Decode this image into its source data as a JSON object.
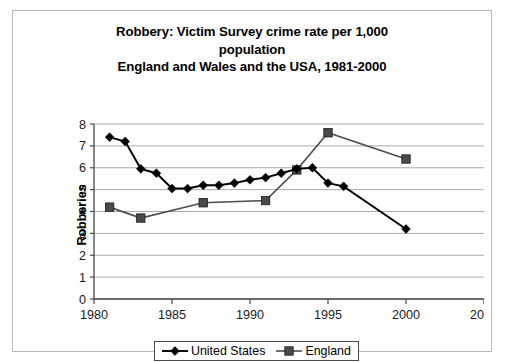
{
  "chart_data": {
    "type": "line",
    "title": "Robbery: Victim Survey crime rate per 1,000 population England and Wales and the USA, 1981-2000",
    "title_lines": [
      "Robbery: Victim Survey crime rate per 1,000",
      "population",
      "England and Wales and the USA, 1981-2000"
    ],
    "xlabel": "",
    "ylabel": "Robberies",
    "xlim": [
      1980,
      2005
    ],
    "ylim": [
      0,
      8
    ],
    "xticks": [
      1980,
      1985,
      1990,
      1995,
      2000,
      2005
    ],
    "yticks": [
      0,
      1,
      2,
      3,
      4,
      5,
      6,
      7,
      8
    ],
    "grid": "horizontal",
    "legend_position": "bottom",
    "series": [
      {
        "name": "United States",
        "marker": "diamond",
        "color": "#000000",
        "x": [
          1981,
          1982,
          1983,
          1984,
          1985,
          1986,
          1987,
          1988,
          1989,
          1990,
          1991,
          1992,
          1993,
          1994,
          1995,
          1996,
          2000
        ],
        "values": [
          7.4,
          7.2,
          5.95,
          5.75,
          5.05,
          5.05,
          5.2,
          5.2,
          5.3,
          5.45,
          5.55,
          5.75,
          5.95,
          6.0,
          5.3,
          5.15,
          3.2
        ]
      },
      {
        "name": "England",
        "marker": "square",
        "color": "#4a4a4a",
        "x": [
          1981,
          1983,
          1987,
          1991,
          1993,
          1995,
          2000
        ],
        "values": [
          4.2,
          3.7,
          4.4,
          4.5,
          5.9,
          7.6,
          6.4
        ]
      }
    ]
  },
  "legend": {
    "items": [
      {
        "label": "United States"
      },
      {
        "label": "England"
      }
    ]
  }
}
